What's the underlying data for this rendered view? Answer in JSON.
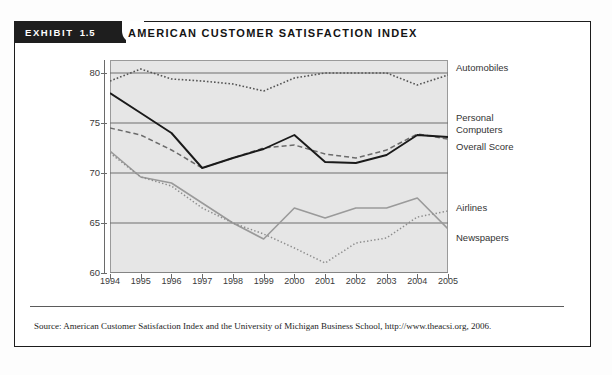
{
  "exhibit": {
    "label": "EXHIBIT",
    "number": "1.5"
  },
  "chart_title": "AMERICAN CUSTOMER SATISFACTION INDEX",
  "source_note": "Source: American Customer Satisfaction Index and the University of Michigan Business School, http://www.theacsi.org, 2006.",
  "legend": [
    {
      "name": "legend-automobiles",
      "label": "Automobiles",
      "top": 62
    },
    {
      "name": "legend-personal-computers",
      "label": "Personal\nComputers",
      "top": 112
    },
    {
      "name": "legend-overall-score",
      "label": "Overall Score",
      "top": 141
    },
    {
      "name": "legend-airlines",
      "label": "Airlines",
      "top": 202
    },
    {
      "name": "legend-newspapers",
      "label": "Newspapers",
      "top": 232
    }
  ],
  "axis": {
    "y_ticks": [
      "80",
      "75",
      "70",
      "65",
      "60"
    ],
    "x_ticks": [
      "1994",
      "1995",
      "1996",
      "1997",
      "1998",
      "1999",
      "2000",
      "2001",
      "2002",
      "2003",
      "2004",
      "2005"
    ]
  },
  "colors": {
    "exhibit_tab_bg": "#1e1e1e",
    "plot_bg": "#e6e6e6",
    "gridline": "#6f6f6f",
    "automobiles": "#555555",
    "personal_computers": "#6b6b6b",
    "overall_score": "#1a1a1a",
    "airlines": "#9a9a9a",
    "newspapers": "#8d8d8d"
  },
  "chart_data": {
    "type": "line",
    "title": "AMERICAN CUSTOMER SATISFACTION INDEX",
    "xlabel": "",
    "ylabel": "",
    "ylim": [
      60,
      81.3
    ],
    "xlim": [
      "1994",
      "2005"
    ],
    "grid": true,
    "legend_position": "right",
    "categories": [
      "1994",
      "1995",
      "1996",
      "1997",
      "1998",
      "1999",
      "2000",
      "2001",
      "2002",
      "2003",
      "2004",
      "2005"
    ],
    "series": [
      {
        "name": "Automobiles",
        "style": "dotted",
        "values": [
          79.2,
          80.4,
          79.4,
          79.2,
          78.9,
          78.2,
          79.5,
          80.0,
          80.0,
          80.0,
          78.8,
          79.8
        ]
      },
      {
        "name": "Personal Computers",
        "style": "dashed",
        "values": [
          74.5,
          73.8,
          72.3,
          70.5,
          71.5,
          72.5,
          72.8,
          71.9,
          71.5,
          72.3,
          73.9,
          73.4
        ]
      },
      {
        "name": "Overall Score",
        "style": "solid",
        "values": [
          78.0,
          76.0,
          74.0,
          70.5,
          71.5,
          72.4,
          73.8,
          71.1,
          71.0,
          71.8,
          73.8,
          73.6
        ]
      },
      {
        "name": "Airlines",
        "style": "solid-gray",
        "values": [
          72.2,
          69.6,
          69.0,
          67.0,
          65.0,
          63.4,
          66.5,
          65.5,
          66.5,
          66.5,
          67.5,
          64.4
        ]
      },
      {
        "name": "Newspapers",
        "style": "fine-dotted",
        "values": [
          72.0,
          69.6,
          68.7,
          66.5,
          65.0,
          63.9,
          62.5,
          61.0,
          63.0,
          63.5,
          65.6,
          66.2
        ]
      }
    ]
  }
}
